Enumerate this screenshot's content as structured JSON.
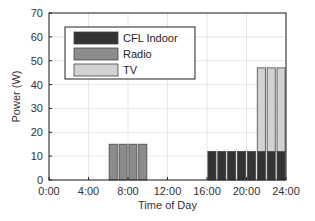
{
  "chart_data": {
    "type": "bar",
    "stacked": true,
    "title": "",
    "xlabel": "Time of Day",
    "ylabel": "Power (W)",
    "xlim": [
      0,
      24
    ],
    "ylim": [
      0,
      70
    ],
    "xticks": [
      "0:00",
      "4:00",
      "8:00",
      "12:00",
      "16:00",
      "20:00",
      "24:00"
    ],
    "yticks": [
      0,
      10,
      20,
      30,
      40,
      50,
      60,
      70
    ],
    "grid": true,
    "legend_position": "upper left",
    "hours": [
      0,
      1,
      2,
      3,
      4,
      5,
      6,
      7,
      8,
      9,
      10,
      11,
      12,
      13,
      14,
      15,
      16,
      17,
      18,
      19,
      20,
      21,
      22,
      23
    ],
    "series": [
      {
        "name": "CFL Indoor",
        "color": "#333333",
        "values": [
          0,
          0,
          0,
          0,
          0,
          0,
          0,
          0,
          0,
          0,
          0,
          0,
          0,
          0,
          0,
          0,
          12,
          12,
          12,
          12,
          12,
          12,
          12,
          12
        ]
      },
      {
        "name": "Radio",
        "color": "#8c8c8c",
        "values": [
          0,
          0,
          0,
          0,
          0,
          0,
          15,
          15,
          15,
          15,
          0,
          0,
          0,
          0,
          0,
          0,
          0,
          0,
          0,
          0,
          0,
          0,
          0,
          0
        ]
      },
      {
        "name": "TV",
        "color": "#d2d2d2",
        "values": [
          0,
          0,
          0,
          0,
          0,
          0,
          0,
          0,
          0,
          0,
          0,
          0,
          0,
          0,
          0,
          0,
          0,
          0,
          0,
          0,
          0,
          35,
          35,
          35
        ]
      }
    ]
  }
}
